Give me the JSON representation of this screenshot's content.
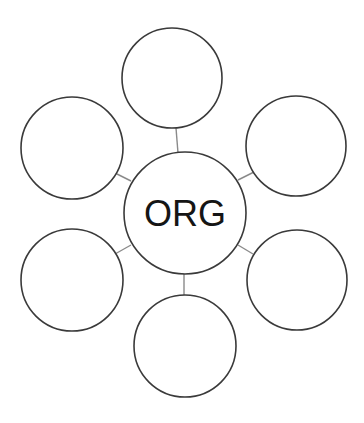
{
  "diagram": {
    "type": "spider-map",
    "center": {
      "label": "ORG",
      "cx": 185,
      "cy": 213,
      "r": 61
    },
    "satellites": [
      {
        "position": "top",
        "label": "",
        "cx": 172,
        "cy": 78,
        "r": 50
      },
      {
        "position": "upper-left",
        "label": "",
        "cx": 72,
        "cy": 148,
        "r": 51
      },
      {
        "position": "upper-right",
        "label": "",
        "cx": 296,
        "cy": 146,
        "r": 50
      },
      {
        "position": "lower-left",
        "label": "",
        "cx": 72,
        "cy": 280,
        "r": 51
      },
      {
        "position": "lower-right",
        "label": "",
        "cx": 297,
        "cy": 280,
        "r": 50
      },
      {
        "position": "bottom",
        "label": "",
        "cx": 185,
        "cy": 346,
        "r": 51
      }
    ],
    "connectors": [
      {
        "to": "top",
        "x1": 176,
        "y1": 128,
        "x2": 178,
        "y2": 153
      },
      {
        "to": "upper-left",
        "x1": 115,
        "y1": 173,
        "x2": 131,
        "y2": 181
      },
      {
        "to": "upper-right",
        "x1": 238,
        "y1": 180,
        "x2": 254,
        "y2": 172
      },
      {
        "to": "lower-left",
        "x1": 115,
        "y1": 254,
        "x2": 131,
        "y2": 245
      },
      {
        "to": "lower-right",
        "x1": 238,
        "y1": 245,
        "x2": 253,
        "y2": 254
      },
      {
        "to": "bottom",
        "x1": 184,
        "y1": 273,
        "x2": 184,
        "y2": 295
      }
    ],
    "colors": {
      "background": "#ffffff",
      "circle_stroke": "#3a3a3a",
      "connector_stroke": "#8a8a8a",
      "text": "#151515"
    }
  }
}
